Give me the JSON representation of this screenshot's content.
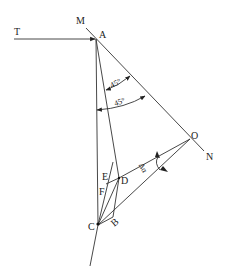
{
  "diagram": {
    "points": {
      "T": {
        "label": "T",
        "x": 17,
        "y": 36
      },
      "M": {
        "label": "M",
        "x": 80,
        "y": 24
      },
      "A": {
        "label": "A",
        "x": 96,
        "y": 38
      },
      "O": {
        "label": "O",
        "x": 190,
        "y": 140
      },
      "N": {
        "label": "N",
        "x": 206,
        "y": 157
      },
      "C": {
        "label": "C",
        "x": 98,
        "y": 225
      },
      "D": {
        "label": "D",
        "x": 120,
        "y": 176
      },
      "B": {
        "label": "B",
        "x": 113,
        "y": 218
      },
      "E": {
        "label": "E",
        "x": 103,
        "y": 175
      },
      "F": {
        "label": "F",
        "x": 102,
        "y": 190
      }
    },
    "angles": {
      "upper": "45°",
      "lower": "45°",
      "delta": "Δα"
    }
  }
}
